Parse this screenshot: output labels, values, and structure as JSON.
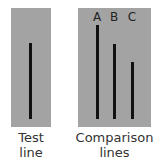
{
  "diagram": {
    "test_panel": {
      "caption_line1": "Test",
      "caption_line2": "line"
    },
    "comparison_panel": {
      "caption_line1": "Comparison",
      "caption_line2": "lines",
      "lines": [
        {
          "label": "A"
        },
        {
          "label": "B"
        },
        {
          "label": "C"
        }
      ]
    },
    "colors": {
      "panel": "#a3a3a3",
      "line": "#111111",
      "text": "#333333"
    }
  }
}
